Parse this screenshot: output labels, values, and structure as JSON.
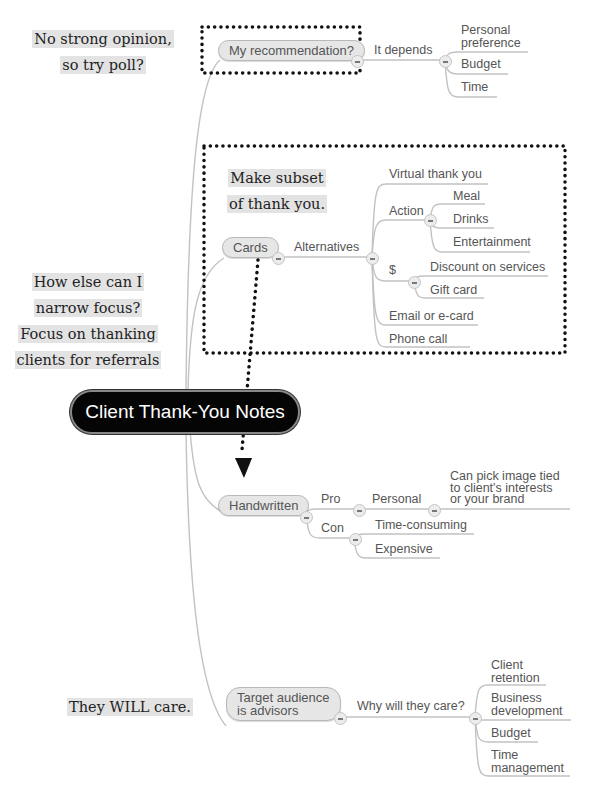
{
  "central_topic": "Client Thank-You Notes",
  "annotations": [
    {
      "lines": [
        "No strong opinion,",
        "so try poll?"
      ]
    },
    {
      "lines": [
        "Make subset",
        "of thank you."
      ]
    },
    {
      "lines": [
        "How else can I",
        "narrow focus?",
        "Focus on thanking",
        "clients for referrals"
      ]
    },
    {
      "lines": [
        "They WILL care."
      ]
    }
  ],
  "branches": {
    "recommendation": {
      "label": "My recommendation?",
      "child": "It depends",
      "items": [
        "Personal",
        "preference",
        "Budget",
        "Time"
      ]
    },
    "cards": {
      "label": "Cards",
      "child": "Alternatives",
      "items": {
        "virtual": "Virtual thank you",
        "action": "Action",
        "action_items": [
          "Meal",
          "Drinks",
          "Entertainment"
        ],
        "money": "$",
        "money_items": [
          "Discount on services",
          "Gift card"
        ],
        "email": "Email or e-card",
        "phone": "Phone call"
      }
    },
    "handwritten": {
      "label": "Handwritten",
      "pro": "Pro",
      "personal": "Personal",
      "personal_detail": [
        "Can pick image tied",
        "to client's interests",
        "or your brand"
      ],
      "con": "Con",
      "con_items": [
        "Time-consuming",
        "Expensive"
      ]
    },
    "audience": {
      "label_lines": [
        "Target audience",
        "is advisors"
      ],
      "child": "Why will they care?",
      "items": [
        [
          "Client",
          "retention"
        ],
        [
          "Business",
          "development"
        ],
        [
          "Budget"
        ],
        [
          "Time",
          "management"
        ]
      ]
    }
  },
  "colors": {
    "connector": "#c2c2c2",
    "node_fill": "#e6e6e6",
    "central_fill": "#050505",
    "annotation_highlight": "#e3e3e3",
    "dotted_border": "#111111"
  }
}
